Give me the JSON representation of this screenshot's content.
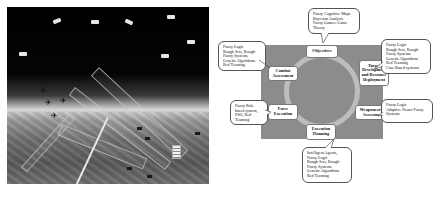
{
  "photo": {
    "description": "Battlefield scene with satellites, aircraft and sensor beams over terrain"
  },
  "diagram": {
    "nodes": {
      "objectives": "Objectives",
      "target_development": [
        "Target",
        "Development",
        "and Resource",
        "Deployment"
      ],
      "weaponeering": [
        "Weaponeering",
        "Assessment"
      ],
      "execution_planning": [
        "Execution",
        "Planning"
      ],
      "force_execution": [
        "Force",
        "Execution"
      ],
      "combat_assessment": [
        "Combat",
        "Assessment"
      ]
    },
    "callouts": {
      "objectives": [
        "Fuzzy Cognitive Maps",
        "Bayesian Analysis",
        "Fuzzy Games; Game",
        "Theory"
      ],
      "combat_assessment": [
        "Fuzzy Logic",
        "Rough Sets, Rough-",
        "Fuzzy Systems",
        "Genetic Algorithms",
        "Red Teaming"
      ],
      "target_development": [
        "Fuzzy Logic",
        "Rough Sets, Rough-",
        "Fuzzy Systems",
        "Genetic Algorithms",
        "Red Teaming",
        "Case Based systems"
      ],
      "force_execution": [
        "Fuzzy Rule",
        "based system,",
        "PSO, Red",
        "Teaming"
      ],
      "weaponeering": [
        "Fuzzy Logic",
        "Adaptive Neuro-Fuzzy",
        "Systems"
      ],
      "execution_planning": [
        "Intelligent Agents,",
        "Fuzzy Logic",
        "Rough Sets, Rough-",
        "Fuzzy Systems",
        "Genetic Algorithms",
        "Red Teaming"
      ]
    },
    "colors": {
      "background_rect": "#8c8c8c",
      "ring": "#bdbdbd",
      "box_fill": "#ffffff"
    }
  }
}
